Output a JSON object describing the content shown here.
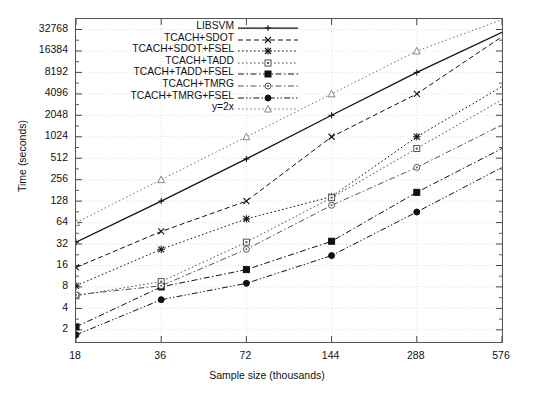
{
  "chart_data": {
    "type": "line",
    "title": "",
    "xlabel": "Sample size (thousands)",
    "ylabel": "Time (seconds)",
    "xscale": "log2",
    "yscale": "log2",
    "x": [
      18,
      36,
      72,
      144,
      288,
      576
    ],
    "xtick_labels": [
      "18",
      "36",
      "72",
      "144",
      "288",
      "576"
    ],
    "ytick_labels": [
      "2",
      "4",
      "8",
      "16",
      "32",
      "64",
      "128",
      "256",
      "512",
      "1024",
      "2048",
      "4096",
      "8192",
      "16384",
      "32768"
    ],
    "ytick_values": [
      2,
      4,
      8,
      16,
      32,
      64,
      128,
      256,
      512,
      1024,
      2048,
      4096,
      8192,
      16384,
      32768
    ],
    "ylim": [
      1.35,
      46000
    ],
    "xlim": [
      18,
      576
    ],
    "grid": true,
    "legend_position": "top-center",
    "series": [
      {
        "name": "LIBSVM",
        "marker": "plus",
        "dash": "solid",
        "color": "#111111",
        "x": [
          18,
          36,
          72,
          144,
          288
        ],
        "values": [
          34,
          128,
          500,
          2048,
          8192
        ],
        "extrapolated_to": [
          576,
          30000
        ]
      },
      {
        "name": "TCACH+SDOT",
        "marker": "cross",
        "dash": "dashed",
        "color": "#111111",
        "x": [
          18,
          36,
          72,
          144,
          288
        ],
        "values": [
          15,
          48,
          128,
          1024,
          4096
        ],
        "extrapolated_to": [
          576,
          26000
        ]
      },
      {
        "name": "TCACH+SDOT+FSEL",
        "marker": "star",
        "dash": "dotted",
        "color": "#111111",
        "x": [
          18,
          36,
          72,
          144,
          288
        ],
        "values": [
          8.3,
          27,
          72,
          148,
          1024
        ],
        "extrapolated_to": [
          576,
          5200
        ]
      },
      {
        "name": "TCACH+TADD",
        "marker": "open-square",
        "dash": "dotted",
        "color": "#555555",
        "x": [
          18,
          36,
          72,
          144,
          288
        ],
        "values": [
          6.0,
          9.5,
          34,
          143,
          700
        ],
        "extrapolated_to": [
          576,
          3400
        ]
      },
      {
        "name": "TCACH+TADD+FSEL",
        "marker": "filled-square",
        "dash": "dash-dot",
        "color": "#111111",
        "x": [
          18,
          36,
          72,
          144,
          288
        ],
        "values": [
          2.2,
          8.0,
          14,
          35,
          170
        ],
        "extrapolated_to": [
          576,
          700
        ]
      },
      {
        "name": "TCACH+TMRG",
        "marker": "open-circle",
        "dash": "dash-dot",
        "color": "#555555",
        "x": [
          18,
          36,
          72,
          144,
          288
        ],
        "values": [
          6.2,
          8.3,
          27,
          112,
          380
        ],
        "extrapolated_to": [
          576,
          1500
        ]
      },
      {
        "name": "TCACH+TMRG+FSEL",
        "marker": "filled-circle",
        "dash": "dash-dot-dot",
        "color": "#111111",
        "x": [
          18,
          36,
          72,
          144,
          288
        ],
        "values": [
          1.7,
          5.3,
          9.0,
          22,
          90
        ],
        "extrapolated_to": [
          576,
          380
        ]
      },
      {
        "name": "y=2x",
        "marker": "open-triangle",
        "dash": "dotted",
        "color": "#777777",
        "x": [
          18,
          36,
          72,
          144,
          288
        ],
        "values": [
          64,
          256,
          1024,
          4096,
          16384
        ],
        "extrapolated_to": [
          576,
          45000
        ]
      }
    ]
  }
}
